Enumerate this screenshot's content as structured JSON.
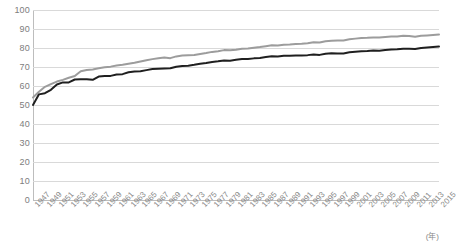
{
  "chart_data": {
    "type": "line",
    "title": "",
    "xlabel": "(年)",
    "ylabel": "",
    "ylim": [
      0,
      100
    ],
    "yticks": [
      100,
      90,
      80,
      70,
      60,
      50,
      40,
      30,
      20,
      10,
      0
    ],
    "grid": true,
    "legend": "none",
    "x": [
      1947,
      1948,
      1949,
      1950,
      1951,
      1952,
      1953,
      1954,
      1955,
      1956,
      1957,
      1958,
      1959,
      1960,
      1961,
      1962,
      1963,
      1964,
      1965,
      1966,
      1967,
      1968,
      1969,
      1970,
      1971,
      1972,
      1973,
      1974,
      1975,
      1976,
      1977,
      1978,
      1979,
      1980,
      1981,
      1982,
      1983,
      1984,
      1985,
      1986,
      1987,
      1988,
      1989,
      1990,
      1991,
      1992,
      1993,
      1994,
      1995,
      1996,
      1997,
      1998,
      1999,
      2000,
      2001,
      2002,
      2003,
      2004,
      2005,
      2006,
      2007,
      2008,
      2009,
      2010,
      2011,
      2012,
      2013,
      2014,
      2015
    ],
    "xticks": [
      "1947",
      "1949",
      "1951",
      "1953",
      "1955",
      "1957",
      "1959",
      "1961",
      "1963",
      "1965",
      "1967",
      "1969",
      "1971",
      "1973",
      "1975",
      "1977",
      "1979",
      "1981",
      "1983",
      "1985",
      "1987",
      "1989",
      "1991",
      "1993",
      "1995",
      "1997",
      "1999",
      "2001",
      "2003",
      "2005",
      "2007",
      "2009",
      "2011",
      "2013",
      "2015"
    ],
    "xtick_step_years": 2,
    "series": [
      {
        "name": "female",
        "color": "#9c9c9c",
        "values": [
          53.96,
          57.0,
          59.57,
          60.99,
          62.34,
          63.24,
          64.36,
          65.22,
          67.75,
          68.41,
          68.73,
          69.3,
          69.9,
          70.19,
          70.79,
          71.16,
          71.71,
          72.2,
          72.92,
          73.59,
          74.15,
          74.66,
          75.05,
          74.66,
          75.58,
          76.0,
          76.13,
          76.31,
          76.89,
          77.35,
          77.95,
          78.33,
          78.89,
          78.76,
          79.13,
          79.66,
          79.78,
          80.18,
          80.48,
          80.93,
          81.39,
          81.3,
          81.77,
          81.9,
          82.11,
          82.22,
          82.51,
          82.98,
          82.85,
          83.59,
          83.82,
          84.01,
          83.99,
          84.6,
          84.93,
          85.23,
          85.33,
          85.59,
          85.52,
          85.81,
          85.99,
          86.05,
          86.44,
          86.3,
          85.9,
          86.41,
          86.61,
          86.83,
          87.05
        ]
      },
      {
        "name": "male",
        "color": "#1f1f1f",
        "values": [
          50.06,
          55.6,
          56.2,
          58.0,
          60.8,
          61.9,
          61.9,
          63.41,
          63.6,
          63.59,
          63.24,
          64.98,
          65.21,
          65.32,
          66.03,
          66.23,
          67.21,
          67.67,
          67.74,
          68.35,
          68.91,
          69.05,
          69.18,
          69.31,
          70.17,
          70.5,
          70.7,
          71.16,
          71.73,
          72.15,
          72.69,
          72.97,
          73.46,
          73.35,
          73.79,
          74.22,
          74.2,
          74.54,
          74.78,
          75.23,
          75.61,
          75.54,
          75.91,
          75.92,
          76.11,
          76.09,
          76.25,
          76.57,
          76.38,
          77.01,
          77.19,
          77.16,
          77.1,
          77.72,
          78.07,
          78.32,
          78.36,
          78.64,
          78.56,
          79.0,
          79.19,
          79.29,
          79.59,
          79.55,
          79.44,
          79.94,
          80.21,
          80.5,
          80.75
        ]
      }
    ]
  }
}
